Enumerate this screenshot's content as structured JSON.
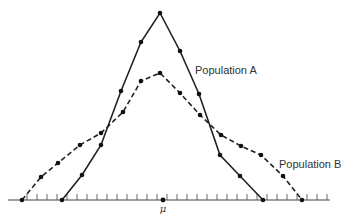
{
  "chart_data": {
    "type": "line",
    "title": "",
    "xlabel": "",
    "ylabel": "",
    "grid": false,
    "x_tick_labels": [
      {
        "position": "center",
        "label": "μ"
      }
    ],
    "series": [
      {
        "name": "Population A",
        "style": "solid",
        "points": [
          [
            62,
            200
          ],
          [
            82,
            175
          ],
          [
            101,
            145
          ],
          [
            121,
            91
          ],
          [
            141,
            42
          ],
          [
            160,
            13
          ],
          [
            180,
            51
          ],
          [
            199,
            94
          ],
          [
            220,
            155
          ],
          [
            240,
            176
          ],
          [
            263,
            200
          ]
        ]
      },
      {
        "name": "Population B",
        "style": "dashed",
        "points": [
          [
            22,
            200
          ],
          [
            41,
            177
          ],
          [
            58,
            163
          ],
          [
            80,
            145
          ],
          [
            101,
            133
          ],
          [
            123,
            112
          ],
          [
            141,
            81
          ],
          [
            160,
            73
          ],
          [
            180,
            93
          ],
          [
            200,
            115
          ],
          [
            221,
            135
          ],
          [
            241,
            146
          ],
          [
            261,
            155
          ],
          [
            283,
            176
          ],
          [
            302,
            200
          ]
        ]
      }
    ],
    "annotations": [
      {
        "text": "Population A",
        "x": 195,
        "y": 74
      },
      {
        "text": "Population B",
        "x": 279,
        "y": 168
      }
    ],
    "axis": {
      "y": 200,
      "x_start": 8,
      "x_end": 330,
      "tick_start": 27,
      "tick_step": 10,
      "tick_count": 31
    },
    "mean_marker": {
      "x": 163,
      "y": 200,
      "label": "μ"
    }
  }
}
